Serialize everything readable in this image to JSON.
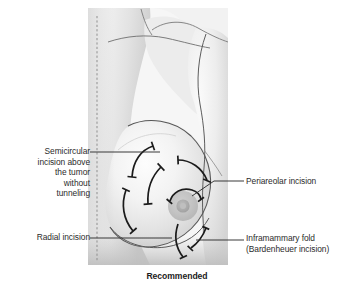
{
  "figure": {
    "caption": "Recommended"
  },
  "labels": {
    "semicircular": "Semicircular\nincision above\nthe tumor\nwithout\ntunneling",
    "radial": "Radial incision",
    "periareolar": "Periareolar incision",
    "inframammary": "Inframammary fold\n(Bardenheuer incision)"
  },
  "colors": {
    "skin_light": "#f2f2f2",
    "skin_mid": "#dcdcdc",
    "skin_shadow": "#bcbcbc",
    "outline": "#4a4a4a",
    "incision": "#1b1b1b",
    "leader": "#2f2f2f",
    "areola": "#c2c2c2",
    "nipple": "#a9a9a9",
    "text": "#2b2b2b",
    "midline_dash": "#8f8f8f"
  },
  "anatomy": {
    "midline": "dashed-vertical-reference-line",
    "areola_label": "areola",
    "nipple_label": "nipple",
    "clavicle_label": "clavicle-contour",
    "axilla_label": "axilla-arm-contour",
    "inframammary_fold_label": "inframammary-fold-contour"
  },
  "incisions": [
    {
      "id": "arc-upper-left-outer",
      "name": "semicircular-incision-upper-left-outer"
    },
    {
      "id": "arc-upper-left-inner",
      "name": "semicircular-incision-upper-left-inner"
    },
    {
      "id": "arc-upper-right",
      "name": "semicircular-incision-upper-right"
    },
    {
      "id": "arc-lower-left",
      "name": "radial-incision-lower-left"
    },
    {
      "id": "arc-periareolar",
      "name": "periareolar-incision-arc"
    },
    {
      "id": "arc-inframammary",
      "name": "inframammary-fold-incision-arc"
    }
  ]
}
